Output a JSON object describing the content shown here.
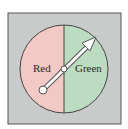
{
  "spinner": {
    "sections": [
      {
        "label": "Red",
        "color": "#f2c9c4"
      },
      {
        "label": "Green",
        "color": "#bcdcc2"
      }
    ],
    "background_color": "#c9cbcb",
    "pointer": "arrow pointing to Green"
  }
}
